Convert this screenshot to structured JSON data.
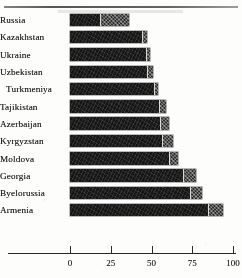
{
  "chart_data": {
    "type": "bar",
    "orientation": "horizontal",
    "stacked": true,
    "title": "",
    "subtitle": "",
    "xlabel": "",
    "ylabel": "",
    "xlim": [
      0,
      100
    ],
    "ylim": null,
    "grid": false,
    "legend": null,
    "legend_position": "none",
    "xticks": [
      0,
      25,
      50,
      75,
      100
    ],
    "xtick_labels": [
      "0",
      "25",
      "50",
      "75",
      "100"
    ],
    "categories": [
      "Russia",
      "Kazakhstan",
      "Ukraine",
      "Uzbekistan",
      "Turkmeniya",
      "Tajikistan",
      "Azerbaijan",
      "Kyrgyzstan",
      "Moldova",
      "Georgia",
      "Byelorussia",
      "Armenia"
    ],
    "series": [
      {
        "name": "segment-a",
        "values": [
          19,
          45,
          47,
          48,
          52,
          55,
          56,
          57,
          61,
          70,
          74,
          85
        ]
      },
      {
        "name": "segment-b",
        "values": [
          17,
          2,
          2,
          3,
          2,
          4,
          5,
          6,
          5,
          7,
          7,
          9
        ]
      }
    ],
    "totals": [
      36,
      47,
      49,
      51,
      54,
      59,
      61,
      63,
      66,
      77,
      81,
      94
    ],
    "annotations": []
  },
  "axis": {
    "tick_labels": [
      "0",
      "25",
      "50",
      "75",
      "100"
    ]
  },
  "colors": {
    "segment_a": "#171717",
    "segment_b": "#2e2e2e",
    "axis": "#2a2a2a",
    "text": "#1d1d1d",
    "background": "#fdfdfb"
  }
}
